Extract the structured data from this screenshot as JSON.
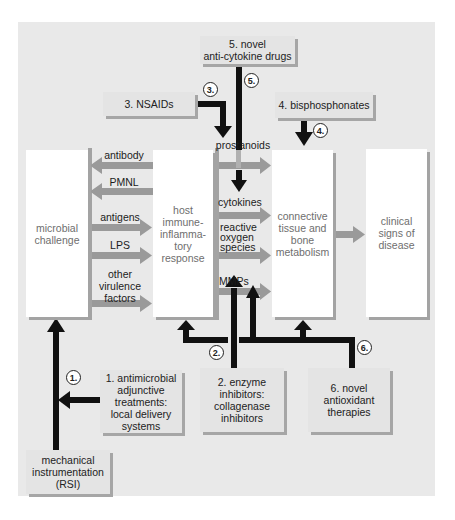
{
  "diagram": {
    "interventions": {
      "anti_cytokine": {
        "number": "5.",
        "label": "5. novel anti-cytokine drugs",
        "line1": "5. novel",
        "line2": "anti-cytokine drugs"
      },
      "nsaids": {
        "number": "3.",
        "label": "3. NSAIDs"
      },
      "bisphosphonates": {
        "number": "4.",
        "label": "4. bisphosphonates"
      },
      "antimicrobial": {
        "number": "1.",
        "line1": "1. antimicrobial",
        "line2": "adjunctive",
        "line3": "treatments:",
        "line4": "local delivery",
        "line5": "systems"
      },
      "enzyme_inhibitors": {
        "number": "2.",
        "line1": "2. enzyme",
        "line2": "inhibitors:",
        "line3": "collagenase",
        "line4": "inhibitors"
      },
      "antioxidant": {
        "number": "6.",
        "line1": "6. novel",
        "line2": "antioxidant",
        "line3": "therapies"
      },
      "mechanical": {
        "line1": "mechanical",
        "line2": "instrumentation",
        "line3": "(RSI)"
      }
    },
    "stages": {
      "microbial": {
        "line1": "microbial",
        "line2": "challenge"
      },
      "host": {
        "line1": "host",
        "line2": "immune-",
        "line3": "inflamma-",
        "line4": "tory",
        "line5": "response"
      },
      "connective": {
        "line1": "connective",
        "line2": "tissue and",
        "line3": "bone",
        "line4": "metabolism"
      },
      "clinical": {
        "line1": "clinical",
        "line2": "signs of",
        "line3": "disease"
      }
    },
    "host_to_microbe": [
      "antibody",
      "PMNL"
    ],
    "microbe_to_host": {
      "antigens": "antigens",
      "lps": "LPS",
      "other1": "other",
      "other2": "virulence",
      "other3": "factors"
    },
    "mediators": {
      "prostanoids": "prostanoids",
      "cytokines": "cytokines",
      "ros1": "reactive",
      "ros2": "oxygen",
      "ros3": "species",
      "mmps": "MMPs"
    },
    "colors": {
      "panel": "#e9e9e9",
      "gray_arrow": "#9a9a9a",
      "black_arrow": "#111111",
      "box_shadow": "#a6a6a6"
    }
  }
}
